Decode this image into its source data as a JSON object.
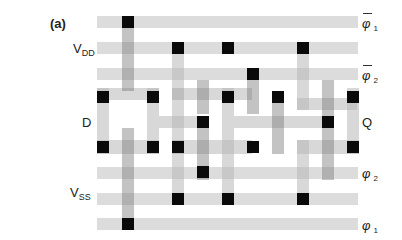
{
  "figure": {
    "panel_label": "(a)",
    "left_labels": [
      {
        "id": "vdd",
        "text": "V",
        "sub": "DD",
        "x": 73,
        "y": 42
      },
      {
        "id": "d",
        "text": "D",
        "sub": "",
        "x": 82,
        "y": 116
      },
      {
        "id": "vss",
        "text": "V",
        "sub": "SS",
        "x": 70,
        "y": 186
      }
    ],
    "right_labels": [
      {
        "id": "phi1-bar",
        "text": "φ",
        "sub": "1",
        "overbar": true,
        "x": 362,
        "y": 16
      },
      {
        "id": "phi2-bar",
        "text": "φ",
        "sub": "2",
        "overbar": true,
        "x": 362,
        "y": 68
      },
      {
        "id": "q",
        "text": "Q",
        "sub": "",
        "overbar": false,
        "x": 362,
        "y": 116
      },
      {
        "id": "phi2",
        "text": "φ",
        "sub": "2",
        "overbar": false,
        "x": 362,
        "y": 166
      },
      {
        "id": "phi1",
        "text": "φ",
        "sub": "1",
        "overbar": false,
        "x": 362,
        "y": 218
      }
    ],
    "colors": {
      "rail": "#dcdcdc",
      "poly": "#c8c8c8",
      "diff": "#d4d4d4",
      "contact": "#0a0a0a"
    },
    "rails": [
      {
        "y": 16,
        "h": 12
      },
      {
        "y": 42,
        "h": 12
      },
      {
        "y": 68,
        "h": 12
      },
      {
        "y": 167,
        "h": 12
      },
      {
        "y": 193,
        "h": 12
      },
      {
        "y": 218,
        "h": 12
      }
    ],
    "regions": [
      {
        "x": 97,
        "y": 88,
        "w": 62,
        "h": 12
      },
      {
        "x": 97,
        "y": 140,
        "w": 62,
        "h": 14
      },
      {
        "x": 97,
        "y": 88,
        "w": 12,
        "h": 66
      },
      {
        "x": 147,
        "y": 88,
        "w": 12,
        "h": 66
      },
      {
        "x": 159,
        "y": 116,
        "w": 50,
        "h": 12
      },
      {
        "x": 172,
        "y": 54,
        "w": 12,
        "h": 46
      },
      {
        "x": 172,
        "y": 88,
        "w": 80,
        "h": 12
      },
      {
        "x": 172,
        "y": 88,
        "w": 12,
        "h": 66
      },
      {
        "x": 172,
        "y": 140,
        "w": 80,
        "h": 14
      },
      {
        "x": 222,
        "y": 88,
        "w": 12,
        "h": 66
      },
      {
        "x": 234,
        "y": 116,
        "w": 92,
        "h": 12
      },
      {
        "x": 297,
        "y": 54,
        "w": 12,
        "h": 56
      },
      {
        "x": 297,
        "y": 98,
        "w": 60,
        "h": 12
      },
      {
        "x": 347,
        "y": 88,
        "w": 12,
        "h": 66
      },
      {
        "x": 297,
        "y": 140,
        "w": 62,
        "h": 14
      },
      {
        "x": 297,
        "y": 140,
        "w": 12,
        "h": 55
      },
      {
        "x": 172,
        "y": 140,
        "w": 12,
        "h": 55
      },
      {
        "x": 222,
        "y": 154,
        "w": 12,
        "h": 41
      }
    ],
    "gates": [
      {
        "x": 122,
        "y": 16,
        "w": 12,
        "h": 75
      },
      {
        "x": 122,
        "y": 128,
        "w": 12,
        "h": 102
      },
      {
        "x": 197,
        "y": 80,
        "w": 12,
        "h": 34
      },
      {
        "x": 197,
        "y": 126,
        "w": 12,
        "h": 54
      },
      {
        "x": 247,
        "y": 68,
        "w": 12,
        "h": 46
      },
      {
        "x": 322,
        "y": 80,
        "w": 12,
        "h": 100
      },
      {
        "x": 272,
        "y": 98,
        "w": 12,
        "h": 56
      }
    ],
    "contacts": [
      {
        "x": 122,
        "y": 16
      },
      {
        "x": 172,
        "y": 42
      },
      {
        "x": 222,
        "y": 42
      },
      {
        "x": 297,
        "y": 42
      },
      {
        "x": 247,
        "y": 68
      },
      {
        "x": 97,
        "y": 91
      },
      {
        "x": 147,
        "y": 91
      },
      {
        "x": 222,
        "y": 91
      },
      {
        "x": 272,
        "y": 91
      },
      {
        "x": 347,
        "y": 91
      },
      {
        "x": 197,
        "y": 116
      },
      {
        "x": 322,
        "y": 116
      },
      {
        "x": 97,
        "y": 141
      },
      {
        "x": 147,
        "y": 141
      },
      {
        "x": 172,
        "y": 141
      },
      {
        "x": 247,
        "y": 141
      },
      {
        "x": 347,
        "y": 141
      },
      {
        "x": 197,
        "y": 166
      },
      {
        "x": 172,
        "y": 193
      },
      {
        "x": 222,
        "y": 193
      },
      {
        "x": 297,
        "y": 193
      },
      {
        "x": 122,
        "y": 218
      }
    ]
  }
}
